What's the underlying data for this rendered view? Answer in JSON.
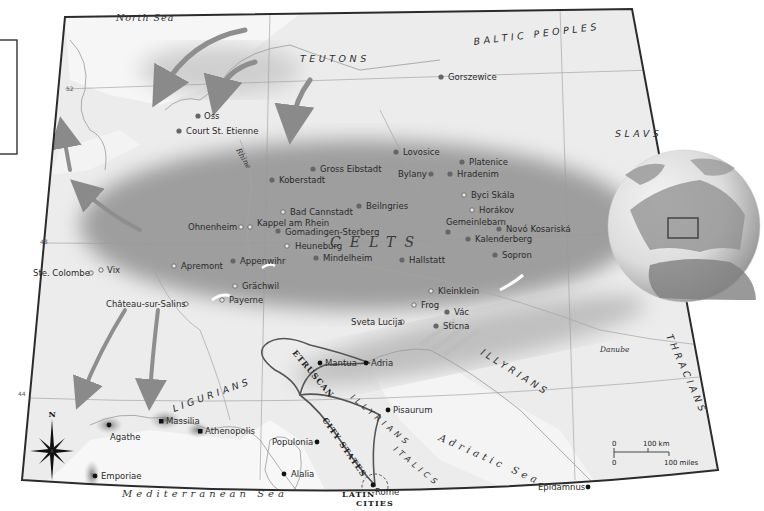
{
  "legend_panel": {
    "visible": true
  },
  "seas": {
    "north_sea": "North Sea",
    "mediterranean": "Mediterranean Sea",
    "adriatic": "Adriatic Sea"
  },
  "rivers": {
    "rhine": "Rhine",
    "danube": "Danube"
  },
  "peoples": {
    "teutons": "TEUTONS",
    "baltic": "BALTIC PEOPLES",
    "slavs": "SLAVS",
    "celts": "CELTS",
    "illyrians_east": "ILLYRIANS",
    "illyrians_italy": "ILLYRIANS",
    "thracians": "THRACIANS",
    "ligurians": "LIGURIANS",
    "etruscan": "ETRUSCAN",
    "city_states": "CITY STATES",
    "italics": "ITALICS",
    "latin": "LATIN",
    "cities": "CITIES"
  },
  "latitudes": [
    "52",
    "48",
    "44"
  ],
  "sites": [
    {
      "name": "Oss",
      "type": "filled",
      "x": 198,
      "y": 116
    },
    {
      "name": "Court St. Etienne",
      "type": "filled",
      "x": 179,
      "y": 131
    },
    {
      "name": "Gorszewice",
      "type": "filled",
      "x": 441,
      "y": 77
    },
    {
      "name": "Lovosice",
      "type": "filled",
      "x": 396,
      "y": 152
    },
    {
      "name": "Platenice",
      "type": "filled",
      "x": 462,
      "y": 162
    },
    {
      "name": "Hradenim",
      "type": "filled",
      "x": 450,
      "y": 174
    },
    {
      "name": "Bylany",
      "type": "filled",
      "x": 431,
      "y": 174
    },
    {
      "name": "Gross Eibstadt",
      "type": "filled",
      "x": 313,
      "y": 169
    },
    {
      "name": "Koberstadt",
      "type": "filled",
      "x": 272,
      "y": 180
    },
    {
      "name": "Byci Skála",
      "type": "open",
      "x": 464,
      "y": 195
    },
    {
      "name": "Horákov",
      "type": "open",
      "x": 472,
      "y": 210
    },
    {
      "name": "Bad Cannstadt",
      "type": "open",
      "x": 283,
      "y": 212
    },
    {
      "name": "Beilngries",
      "type": "filled",
      "x": 359,
      "y": 206
    },
    {
      "name": "Gemeinlebarn",
      "type": "filled",
      "x": 448,
      "y": 232
    },
    {
      "name": "Novó Kosariská",
      "type": "filled",
      "x": 499,
      "y": 229
    },
    {
      "name": "Kalenderberg",
      "type": "filled",
      "x": 468,
      "y": 239
    },
    {
      "name": "Ohnenheim",
      "type": "open",
      "x": 241,
      "y": 227
    },
    {
      "name": "Kappel am Rhein",
      "type": "open",
      "x": 250,
      "y": 227
    },
    {
      "name": "Gomadingen-Sterberg",
      "type": "filled",
      "x": 278,
      "y": 231
    },
    {
      "name": "Heuneburg",
      "type": "open",
      "x": 287,
      "y": 246
    },
    {
      "name": "Sopron",
      "type": "filled",
      "x": 495,
      "y": 255
    },
    {
      "name": "Mindelheim",
      "type": "filled",
      "x": 316,
      "y": 258
    },
    {
      "name": "Hallstatt",
      "type": "filled",
      "x": 402,
      "y": 260
    },
    {
      "name": "Appenwihr",
      "type": "filled",
      "x": 233,
      "y": 261
    },
    {
      "name": "Apremont",
      "type": "open",
      "x": 174,
      "y": 266
    },
    {
      "name": "Vix",
      "type": "open",
      "x": 101,
      "y": 270
    },
    {
      "name": "Ste. Colombe",
      "type": "open",
      "x": 91,
      "y": 273
    },
    {
      "name": "Grächwil",
      "type": "open",
      "x": 235,
      "y": 286
    },
    {
      "name": "Payerne",
      "type": "open",
      "x": 222,
      "y": 300
    },
    {
      "name": "Château-sur-Salins",
      "type": "open",
      "x": 186,
      "y": 304
    },
    {
      "name": "Kleinklein",
      "type": "open",
      "x": 431,
      "y": 291
    },
    {
      "name": "Frog",
      "type": "open",
      "x": 414,
      "y": 305
    },
    {
      "name": "Vác",
      "type": "filled",
      "x": 447,
      "y": 312
    },
    {
      "name": "Sveta Lucija",
      "type": "open",
      "x": 402,
      "y": 322
    },
    {
      "name": "Sticna",
      "type": "filled",
      "x": 436,
      "y": 326
    }
  ],
  "cities": [
    {
      "name": "Mantua",
      "x": 320,
      "y": 363
    },
    {
      "name": "Adria",
      "x": 366,
      "y": 363
    },
    {
      "name": "Pisaurum",
      "x": 388,
      "y": 410
    },
    {
      "name": "Massilia",
      "x": 161,
      "y": 421
    },
    {
      "name": "Athenopolis",
      "x": 200,
      "y": 431
    },
    {
      "name": "Agathe",
      "x": 109,
      "y": 425
    },
    {
      "name": "Populonia",
      "x": 317,
      "y": 442
    },
    {
      "name": "Alalia",
      "x": 284,
      "y": 474
    },
    {
      "name": "Emporiae",
      "x": 95,
      "y": 476
    },
    {
      "name": "Rome",
      "x": 373,
      "y": 485
    },
    {
      "name": "Epidamnus",
      "x": 588,
      "y": 487
    }
  ],
  "compass": {
    "north_label": "N"
  },
  "scale_bar": {
    "km_zero": "0",
    "km_label": "100 km",
    "mi_zero": "0",
    "mi_label": "100 miles"
  },
  "colors": {
    "land": "#ededed",
    "sea": "#f7f7f7",
    "celtic_zone": "#9a9a9a",
    "frame": "#2b2b2b",
    "migration_arrow": "#8a8a8a"
  }
}
